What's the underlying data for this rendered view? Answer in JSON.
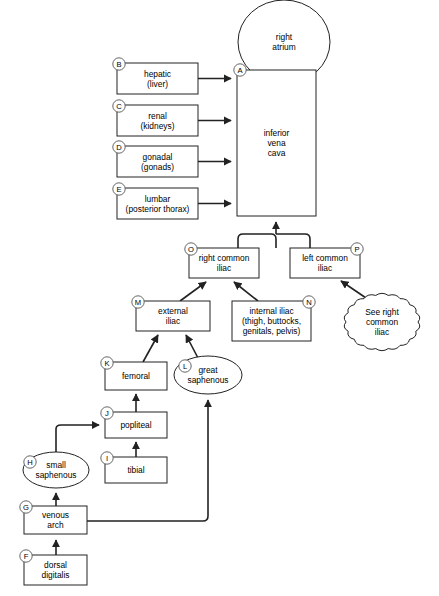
{
  "diagram": {
    "type": "flowchart",
    "background_color": "#ffffff",
    "line_color": "#222222",
    "key_circle_color": "#555555",
    "nodes": [
      {
        "id": "right_atrium",
        "key": "",
        "shape": "circle",
        "lines": [
          "right",
          "atrium"
        ],
        "cx": 284,
        "cy": 42,
        "rx": 46,
        "ry": 42
      },
      {
        "id": "inferior_vena_cava",
        "key": "A",
        "shape": "rect",
        "lines": [
          "inferior",
          "vena",
          "cava"
        ],
        "x": 237,
        "y": 70,
        "w": 79,
        "h": 146,
        "key_x": 240,
        "key_y": 70
      },
      {
        "id": "hepatic",
        "key": "B",
        "shape": "rect",
        "lines": [
          "hepatic",
          "(liver)"
        ],
        "x": 117,
        "y": 63,
        "w": 81,
        "h": 31,
        "key_x": 119,
        "key_y": 64
      },
      {
        "id": "renal",
        "key": "C",
        "shape": "rect",
        "lines": [
          "renal",
          "(kidneys)"
        ],
        "x": 117,
        "y": 105,
        "w": 81,
        "h": 31,
        "key_x": 119,
        "key_y": 106
      },
      {
        "id": "gonadal",
        "key": "D",
        "shape": "rect",
        "lines": [
          "gonadal",
          "(gonads)"
        ],
        "x": 117,
        "y": 146,
        "w": 81,
        "h": 31,
        "key_x": 119,
        "key_y": 147
      },
      {
        "id": "lumbar",
        "key": "E",
        "shape": "rect",
        "lines": [
          "lumbar",
          "(posterior thorax)"
        ],
        "x": 117,
        "y": 188,
        "w": 81,
        "h": 31,
        "key_x": 119,
        "key_y": 189
      },
      {
        "id": "right_common_iliac",
        "key": "O",
        "shape": "rect",
        "lines": [
          "right common",
          "iliac"
        ],
        "x": 189,
        "y": 248,
        "w": 70,
        "h": 30,
        "key_x": 191,
        "key_y": 249
      },
      {
        "id": "left_common_iliac",
        "key": "P",
        "shape": "rect",
        "lines": [
          "left common",
          "iliac"
        ],
        "x": 290,
        "y": 248,
        "w": 70,
        "h": 30,
        "key_x": 357,
        "key_y": 249
      },
      {
        "id": "external_iliac",
        "key": "M",
        "shape": "rect",
        "lines": [
          "external",
          "iliac"
        ],
        "x": 136,
        "y": 301,
        "w": 74,
        "h": 30,
        "key_x": 138,
        "key_y": 302
      },
      {
        "id": "internal_iliac",
        "key": "N",
        "shape": "rect",
        "lines": [
          "internal iliac",
          "(thigh, buttocks,",
          "genitals, pelvis)"
        ],
        "x": 232,
        "y": 301,
        "w": 79,
        "h": 40,
        "key_x": 309,
        "key_y": 302
      },
      {
        "id": "see_right_common_iliac",
        "key": "",
        "shape": "cloud",
        "lines": [
          "See right",
          "common",
          "iliac"
        ],
        "cx": 382,
        "cy": 322,
        "rx": 36,
        "ry": 27
      },
      {
        "id": "femoral",
        "key": "K",
        "shape": "rect",
        "lines": [
          "femoral"
        ],
        "x": 105,
        "y": 362,
        "w": 62,
        "h": 28,
        "key_x": 107,
        "key_y": 363
      },
      {
        "id": "great_saphenous",
        "key": "L",
        "shape": "ellipse",
        "lines": [
          "great",
          "saphenous"
        ],
        "cx": 208,
        "cy": 375,
        "rx": 34,
        "ry": 19,
        "key_x": 185,
        "key_y": 366
      },
      {
        "id": "popliteal",
        "key": "J",
        "shape": "rect",
        "lines": [
          "popliteal"
        ],
        "x": 105,
        "y": 412,
        "w": 62,
        "h": 26,
        "key_x": 107,
        "key_y": 413
      },
      {
        "id": "tibial",
        "key": "I",
        "shape": "rect",
        "lines": [
          "tibial"
        ],
        "x": 105,
        "y": 457,
        "w": 62,
        "h": 26,
        "key_x": 107,
        "key_y": 458
      },
      {
        "id": "small_saphenous",
        "key": "H",
        "shape": "ellipse",
        "lines": [
          "small",
          "saphenous"
        ],
        "cx": 56,
        "cy": 470,
        "rx": 33,
        "ry": 18,
        "key_x": 30,
        "key_y": 462
      },
      {
        "id": "venous_arch",
        "key": "G",
        "shape": "rect",
        "lines": [
          "venous",
          "arch"
        ],
        "x": 24,
        "y": 506,
        "w": 63,
        "h": 28,
        "key_x": 26,
        "key_y": 507
      },
      {
        "id": "dorsal_digitalis",
        "key": "F",
        "shape": "rect",
        "lines": [
          "dorsal",
          "digitalis"
        ],
        "x": 24,
        "y": 555,
        "w": 63,
        "h": 30,
        "key_x": 26,
        "key_y": 556
      }
    ],
    "edges": [
      {
        "id": "hepatic-to-ivc",
        "from": "hepatic",
        "to": "inferior_vena_cava"
      },
      {
        "id": "renal-to-ivc",
        "from": "renal",
        "to": "inferior_vena_cava"
      },
      {
        "id": "gonadal-to-ivc",
        "from": "gonadal",
        "to": "inferior_vena_cava"
      },
      {
        "id": "lumbar-to-ivc",
        "from": "lumbar",
        "to": "inferior_vena_cava"
      },
      {
        "id": "iliacs-to-ivc",
        "from": "right_common_iliac",
        "to": "inferior_vena_cava"
      },
      {
        "id": "external-to-right-common",
        "from": "external_iliac",
        "to": "right_common_iliac"
      },
      {
        "id": "internal-to-right-common",
        "from": "internal_iliac",
        "to": "right_common_iliac"
      },
      {
        "id": "cloud-to-left-common",
        "from": "see_right_common_iliac",
        "to": "left_common_iliac"
      },
      {
        "id": "femoral-to-external",
        "from": "femoral",
        "to": "external_iliac"
      },
      {
        "id": "great-saph-to-external",
        "from": "great_saphenous",
        "to": "external_iliac"
      },
      {
        "id": "popliteal-to-femoral",
        "from": "popliteal",
        "to": "femoral"
      },
      {
        "id": "tibial-to-popliteal",
        "from": "tibial",
        "to": "popliteal"
      },
      {
        "id": "small-saph-to-popliteal",
        "from": "small_saphenous",
        "to": "popliteal"
      },
      {
        "id": "venous-arch-to-small-saph",
        "from": "venous_arch",
        "to": "small_saphenous"
      },
      {
        "id": "venous-arch-to-great-saph",
        "from": "venous_arch",
        "to": "great_saphenous"
      },
      {
        "id": "dorsal-to-venous-arch",
        "from": "dorsal_digitalis",
        "to": "venous_arch"
      }
    ]
  }
}
